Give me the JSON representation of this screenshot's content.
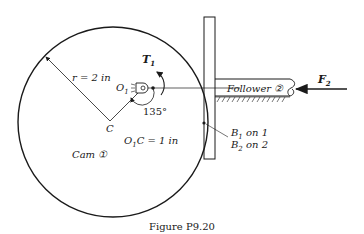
{
  "figure": {
    "caption": "Figure P9.20",
    "colors": {
      "ink": "#1a1a1a",
      "background": "#ffffff"
    }
  },
  "labels": {
    "radius": "r = 2 in",
    "pivot": "O",
    "pivot_sub": "1",
    "torque": "T",
    "torque_sub": "1",
    "angle": "135°",
    "center": "C",
    "offset_o": "O",
    "offset_sub": "1",
    "offset_rest": "C = 1 in",
    "cam": "Cam ①",
    "follower": "Follower ②",
    "force": "F",
    "force_sub": "2",
    "b1": "B",
    "b1_sub": "1",
    "b1_rest": " on 1",
    "b2": "B",
    "b2_sub": "2",
    "b2_rest": " on 2"
  }
}
